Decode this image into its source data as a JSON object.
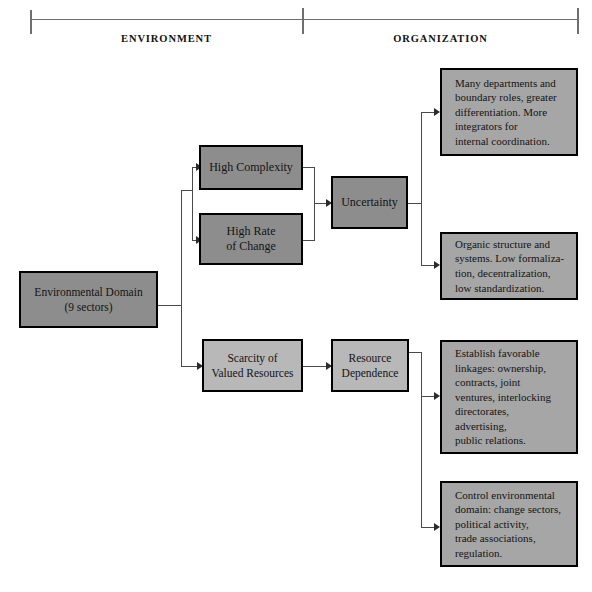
{
  "header": {
    "left_label": "ENVIRONMENT",
    "right_label": "ORGANIZATION"
  },
  "nodes": {
    "environmental_domain": "Environmental Domain\n(9 sectors)",
    "environmental_domain_line1": "Environmental Domain",
    "environmental_domain_line2": "(9 sectors)",
    "high_complexity": "High Complexity",
    "high_rate_of_change_line1": "High Rate",
    "high_rate_of_change_line2": "of Change",
    "uncertainty": "Uncertainty",
    "scarcity_line1": "Scarcity of",
    "scarcity_line2": "Valued Resources",
    "resource_dependence_line1": "Resource",
    "resource_dependence_line2": "Dependence",
    "outcome_1": "Many departments and boundary roles, greater differentiation. More integrators for internal coordination.",
    "outcome_2": "Organic structure and systems. Low formaliza-tion, decentralization, low standardization.",
    "outcome_3": "Establish favorable linkages: ownership, contracts, joint ventures, interlocking directorates, advertising, public relations.",
    "outcome_4": "Control environmental domain: change sectors, political activity, trade associations, regulation."
  },
  "outcome_1_lines": [
    "Many departments and",
    "boundary roles, greater",
    "differentiation. More",
    "integrators for",
    "internal coordination."
  ],
  "outcome_2_lines": [
    "Organic structure and",
    "systems. Low formaliza-",
    "tion, decentralization,",
    "low standardization."
  ],
  "outcome_3_lines": [
    "Establish favorable",
    "linkages: ownership,",
    "contracts, joint",
    "ventures, interlocking",
    "directorates,",
    "advertising,",
    "public relations."
  ],
  "outcome_4_lines": [
    "Control environmental",
    "domain: change sectors,",
    "political activity,",
    "trade associations,",
    "regulation."
  ],
  "colors": {
    "box_dark": "#8d8d8d",
    "box_mid": "#a6a6a6",
    "box_light": "#b8b8b8",
    "border": "#000000",
    "line": "#4a4a4a",
    "bracket": "#6f6f6f",
    "background": "#ffffff"
  }
}
